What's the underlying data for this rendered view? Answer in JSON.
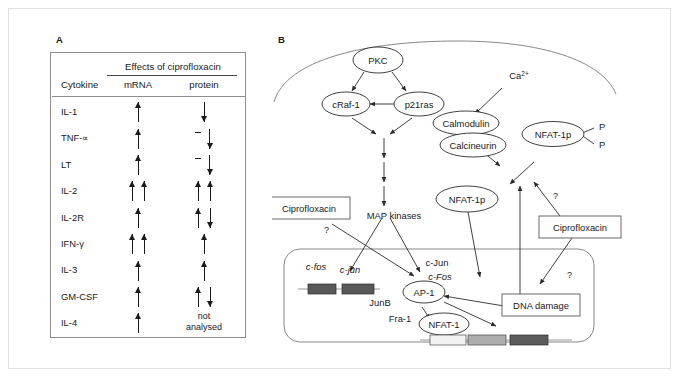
{
  "figure": {
    "panel_a": {
      "label": "A",
      "table": {
        "spanning_header": "Effects of ciprofloxacin",
        "columns": [
          "Cytokine",
          "mRNA",
          "protein"
        ],
        "rows": [
          {
            "cytokine": "IL-1",
            "mrna": [
              "up"
            ],
            "protein": [
              "down"
            ]
          },
          {
            "cytokine": "TNF-∝",
            "mrna": [
              "up"
            ],
            "protein": [
              "dash",
              "down"
            ]
          },
          {
            "cytokine": "LT",
            "mrna": [
              "up"
            ],
            "protein": [
              "dash",
              "down"
            ]
          },
          {
            "cytokine": "IL-2",
            "mrna": [
              "up",
              "up"
            ],
            "protein": [
              "up",
              "up"
            ]
          },
          {
            "cytokine": "IL-2R",
            "mrna": [
              "up"
            ],
            "protein": [
              "up",
              "down"
            ]
          },
          {
            "cytokine": "IFN-γ",
            "mrna": [
              "up",
              "up"
            ],
            "protein": [
              "up"
            ]
          },
          {
            "cytokine": "IL-3",
            "mrna": [
              "up"
            ],
            "protein": [
              "up"
            ]
          },
          {
            "cytokine": "GM-CSF",
            "mrna": [
              "up"
            ],
            "protein": [
              "up",
              "down"
            ]
          },
          {
            "cytokine": "IL-4",
            "mrna": [
              "up"
            ],
            "protein": [],
            "protein_text": "not\nanalysed"
          }
        ]
      }
    },
    "panel_b": {
      "label": "B",
      "nodes": {
        "pkc": "PKC",
        "craf1": "cRaf-1",
        "p21ras": "p21ras",
        "calmodulin": "Calmodulin",
        "calcineurin": "Calcineurin",
        "calcium": "Ca2+",
        "nfat1p_phos": "NFAT-1p",
        "nfat1p": "NFAT-1p",
        "nfat1": "NFAT-1",
        "ap1": "AP-1",
        "map_kinases": "MAP kinases",
        "ciprofloxacin_left": "Ciprofloxacin",
        "ciprofloxacin_right": "Ciprofloxacin",
        "dna_damage": "DNA damage",
        "phosphate_top": "P",
        "phosphate_bottom": "P",
        "cfos_gene": "c-fos",
        "cjun_gene": "c-jun",
        "junb": "JunB",
        "fra1": "Fra-1",
        "cjun_protein": "c-Jun",
        "cfos_protein": "c-Fos",
        "question_1": "?",
        "question_2": "?",
        "question_3": "?"
      }
    }
  }
}
